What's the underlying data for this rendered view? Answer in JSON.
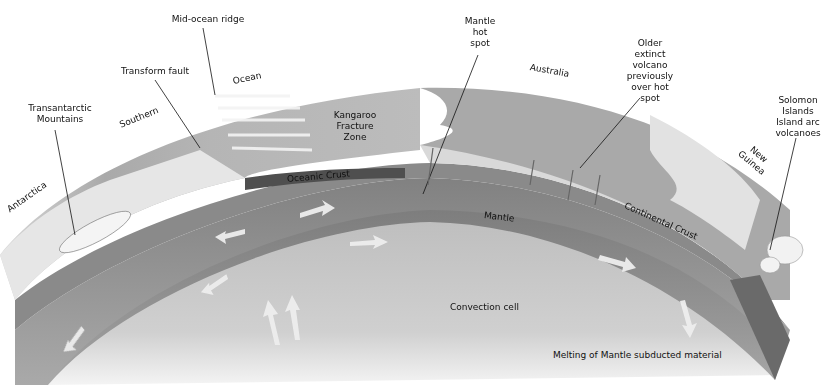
{
  "diagram": {
    "type": "cross-section",
    "colors": {
      "background": "#ffffff",
      "ocean_surface": "#b9b9b9",
      "continent_surface": "#e4e4e4",
      "australia_land": "#a9a9a9",
      "oceanic_crust": "#6f6f6f",
      "mantle_band": "#7c7c7c",
      "convection_interior": "#c8c8c8",
      "arrows": "#ececec",
      "leader_lines": "#111111"
    },
    "callouts": {
      "mid_ocean_ridge": "Mid-ocean ridge",
      "transform_fault": "Transform fault",
      "transantarctic_mountains": "Transantarctic\nMountains",
      "mantle_hot_spot": "Mantle\nhot\nspot",
      "older_extinct_volcano": "Older\nextinct\nvolcano\npreviously\nover hot\nspot",
      "solomon_islands": "Solomon\nIslands\nIsland arc\nvolcanoes"
    },
    "region_labels": {
      "ocean": "Ocean",
      "southern": "Southern",
      "antarctica": "Antarctica",
      "australia": "Australia",
      "new_guinea": "New\nGuinea",
      "kangaroo_fracture_zone": "Kangaroo\nFracture\nZone"
    },
    "layer_labels": {
      "oceanic_crust": "Oceanic Crust",
      "mantle": "Mantle",
      "continental_crust": "Continental Crust",
      "convection_cell": "Convection cell",
      "melting": "Melting of Mantle subducted material"
    }
  }
}
